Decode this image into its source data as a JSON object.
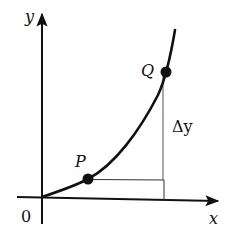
{
  "diagram": {
    "type": "function-increment-illustration",
    "axes": {
      "x_label": "x",
      "y_label": "y",
      "origin_label": "0"
    },
    "points": {
      "P": {
        "label": "P"
      },
      "Q": {
        "label": "Q"
      }
    },
    "annotations": {
      "delta_y": "Δy"
    },
    "colors": {
      "stroke": "#111111",
      "thin_line": "#555555",
      "background": "#ffffff"
    }
  }
}
